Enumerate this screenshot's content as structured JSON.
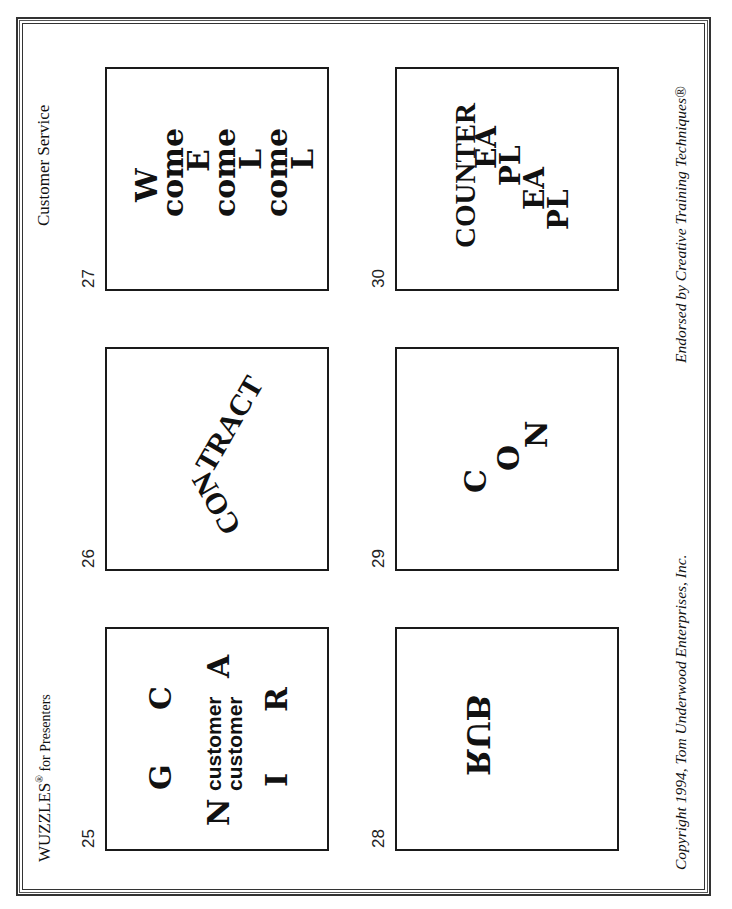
{
  "header": {
    "title": "WUZZLES",
    "registered_mark": "®",
    "title_suffix": " for Presenters",
    "category": "Customer Service"
  },
  "footer": {
    "copyright": "Copyright 1994, Tom Underwood Enterprises, Inc.",
    "endorsement": "Endorsed by Creative Training Techniques®"
  },
  "orientation": "rotated 90° counter-clockwise (landscape page)",
  "puzzles": [
    {
      "number": "25",
      "pieces": {
        "g": "G",
        "c": "C",
        "n": "N",
        "customer1": "customer",
        "customer2": "customer",
        "a": "A",
        "i": "I",
        "r": "R"
      }
    },
    {
      "number": "26",
      "pieces": {
        "con": "CON",
        "tract": "TRACT"
      }
    },
    {
      "number": "27",
      "pieces": {
        "w": "W",
        "come1": "come",
        "e": "E",
        "come2": "come",
        "l1": "L",
        "come3": "come",
        "l2": "L"
      }
    },
    {
      "number": "28",
      "pieces": {
        "rub": "RUB"
      }
    },
    {
      "number": "29",
      "pieces": {
        "c": "C",
        "o": "O",
        "n": "N"
      }
    },
    {
      "number": "30",
      "pieces": {
        "counter": "COUNTER",
        "ea1": "EA",
        "pl1": "PL",
        "ea2": "EA",
        "pl2": "PL"
      }
    }
  ]
}
